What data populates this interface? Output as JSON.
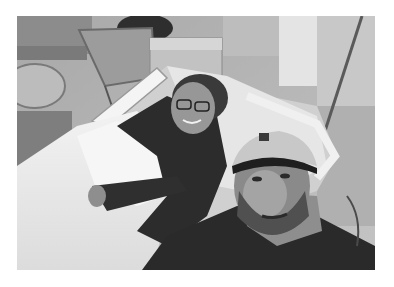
{
  "image": {
    "description": "Black-and-white selfie in a hospital room: a man in a baseball cap and neck gaiter in the foreground, a smiling woman with glasses lying in a hospital bed holding a swaddled newborn wrapped in white blankets.",
    "palette": {
      "background": "#ffffff",
      "wall": "#b8b8b8",
      "window": "#d8d8d8",
      "bed_sheets": "#ececec",
      "dark_clothing": "#2a2a2a",
      "skin": "#8a8a8a"
    },
    "subjects": [
      "man-selfie",
      "woman-in-bed",
      "newborn-swaddled"
    ],
    "objects": [
      "hospital-bed",
      "bed-rails",
      "iv-pole",
      "chair",
      "bassinet",
      "side-table",
      "window"
    ]
  }
}
